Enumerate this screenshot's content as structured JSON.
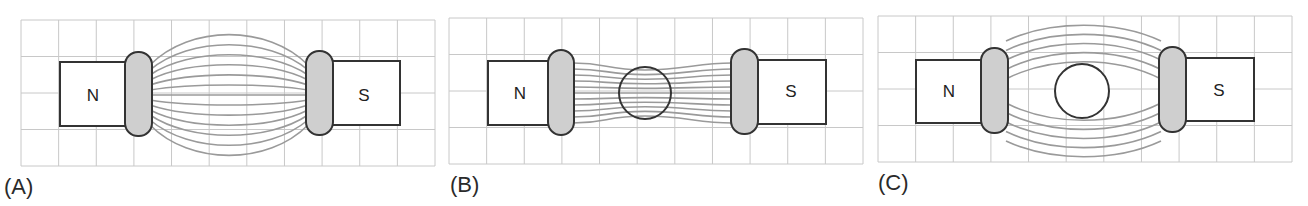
{
  "figure": {
    "panels": [
      {
        "label": "(A)",
        "description": "Uniform magnetic field between two pole pieces",
        "north_label": "N",
        "south_label": "S",
        "object": "none",
        "field_line_count": 13
      },
      {
        "label": "(B)",
        "description": "Field lines concentrated through a ferromagnetic sphere",
        "north_label": "N",
        "south_label": "S",
        "object": "ferromagnetic-sphere",
        "field_line_count": 11
      },
      {
        "label": "(C)",
        "description": "Field lines bending around a diamagnetic/superconducting sphere",
        "north_label": "N",
        "south_label": "S",
        "object": "diamagnetic-sphere",
        "field_line_count": 10
      }
    ],
    "colors": {
      "grid": "#c8c8c8",
      "field_line": "#9a9a9a",
      "outline": "#333333",
      "pole_fill": "#cfcfcf",
      "magnet_fill": "#ffffff"
    }
  }
}
